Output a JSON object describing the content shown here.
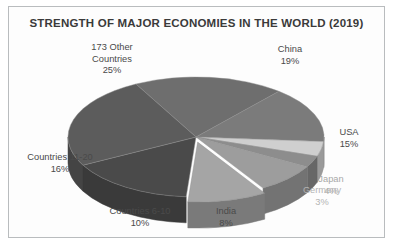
{
  "chart_data": {
    "type": "pie",
    "title": "STRENGTH OF MAJOR ECONOMIES IN THE WORLD (2019)",
    "xlabel": "",
    "ylabel": "",
    "legend": "none",
    "grid": false,
    "three_d": true,
    "categories": [
      "China",
      "USA",
      "Japan",
      "Germany",
      "India",
      "Countries 6-10",
      "Countries 11-20",
      "173 Other Countries"
    ],
    "values": [
      19,
      15,
      4,
      3,
      8,
      10,
      16,
      25
    ],
    "unit": "%",
    "slices": [
      {
        "name": "China",
        "value": 19,
        "pct_label": "19%",
        "color": "#6e6e6e",
        "side_color": "#4f4f4f"
      },
      {
        "name": "USA",
        "value": 15,
        "pct_label": "15%",
        "color": "#7b7b7b",
        "side_color": "#585858"
      },
      {
        "name": "Japan",
        "value": 4,
        "pct_label": "4%",
        "color": "#cfcfcf",
        "side_color": "#9a9a9a"
      },
      {
        "name": "Germany",
        "value": 3,
        "pct_label": "3%",
        "color": "#8d8d8d",
        "side_color": "#676767"
      },
      {
        "name": "India",
        "value": 8,
        "pct_label": "8%",
        "color": "#9d9d9d",
        "side_color": "#737373"
      },
      {
        "name": "Countries 6-10",
        "value": 10,
        "pct_label": "10%",
        "color": "#a5a5a5",
        "side_color": "#7a7a7a"
      },
      {
        "name": "Countries 11-20",
        "value": 16,
        "pct_label": "16%",
        "color": "#4a4a4a",
        "side_color": "#3a3a3a"
      },
      {
        "name": "173 Other Countries",
        "value": 25,
        "pct_label": "25%",
        "color": "#5c5c5c",
        "side_color": "#444444"
      }
    ]
  },
  "labels": {
    "other_countries_line1": "173 Other",
    "other_countries_line2": "Countries",
    "other_countries_pct": "25%",
    "china_name": "China",
    "china_pct": "19%",
    "usa_name": "USA",
    "usa_pct": "15%",
    "japan_name": "Japan",
    "japan_pct": "4%",
    "germany_name": "Germany",
    "germany_pct": "3%",
    "india_name": "India",
    "india_pct": "8%",
    "countries_6_10_name": "Countries 6-10",
    "countries_6_10_pct": "10%",
    "countries_11_20_name": "Countries 11-20",
    "countries_11_20_pct": "16%"
  },
  "colors": {
    "frame_border": "#b9bcbe",
    "background": "#ffffff",
    "title_text": "#3a3a3a",
    "label_text": "#4a4a4a"
  }
}
